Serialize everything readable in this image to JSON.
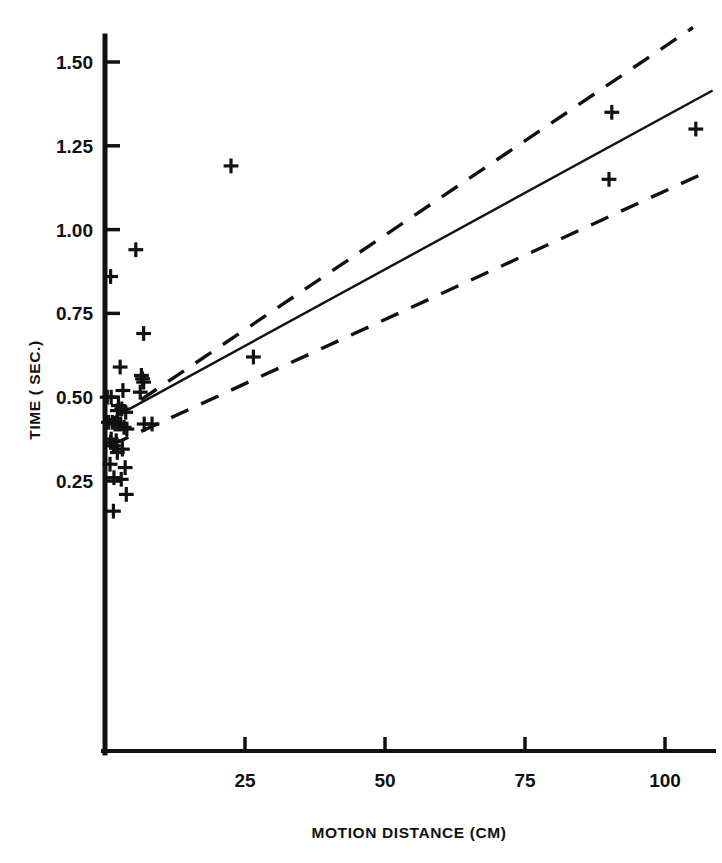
{
  "chart_data": {
    "type": "scatter",
    "title": "",
    "xlabel": "MOTION DISTANCE (CM)",
    "ylabel": "TIME ( SEC.)",
    "xlim": [
      0,
      110
    ],
    "ylim": [
      0,
      1.62
    ],
    "grid": false,
    "legend": "none",
    "marker": "plus",
    "xticks": [
      25,
      50,
      75,
      100
    ],
    "xtick_labels": [
      "25",
      "50",
      "75",
      "100"
    ],
    "yticks": [
      0.25,
      0.5,
      0.75,
      1.0,
      1.25,
      1.5
    ],
    "ytick_labels": [
      "0.25",
      "0.50",
      "0.75",
      "1.00",
      "1.25",
      "1.50"
    ],
    "points": [
      {
        "x": 1.5,
        "y": 0.16
      },
      {
        "x": 3.8,
        "y": 0.21
      },
      {
        "x": 1.6,
        "y": 0.26
      },
      {
        "x": 2.9,
        "y": 0.255
      },
      {
        "x": 0.9,
        "y": 0.3
      },
      {
        "x": 3.6,
        "y": 0.29
      },
      {
        "x": 1.0,
        "y": 0.365
      },
      {
        "x": 2.0,
        "y": 0.37
      },
      {
        "x": 1.5,
        "y": 0.355
      },
      {
        "x": 3.1,
        "y": 0.345
      },
      {
        "x": 1.1,
        "y": 0.375
      },
      {
        "x": 2.2,
        "y": 0.335
      },
      {
        "x": 0.6,
        "y": 0.425
      },
      {
        "x": 1.3,
        "y": 0.425
      },
      {
        "x": 1.8,
        "y": 0.42
      },
      {
        "x": 2.3,
        "y": 0.42
      },
      {
        "x": 2.8,
        "y": 0.42
      },
      {
        "x": 3.4,
        "y": 0.41
      },
      {
        "x": 3.9,
        "y": 0.405
      },
      {
        "x": 7.0,
        "y": 0.42
      },
      {
        "x": 8.4,
        "y": 0.42
      },
      {
        "x": 2.2,
        "y": 0.46
      },
      {
        "x": 3.0,
        "y": 0.465
      },
      {
        "x": 3.7,
        "y": 0.455
      },
      {
        "x": 0.4,
        "y": 0.5
      },
      {
        "x": 1.1,
        "y": 0.5
      },
      {
        "x": 2.4,
        "y": 0.475
      },
      {
        "x": 3.2,
        "y": 0.52
      },
      {
        "x": 6.3,
        "y": 0.515
      },
      {
        "x": 6.9,
        "y": 0.545
      },
      {
        "x": 6.7,
        "y": 0.555
      },
      {
        "x": 6.5,
        "y": 0.565
      },
      {
        "x": 2.7,
        "y": 0.59
      },
      {
        "x": 6.9,
        "y": 0.69
      },
      {
        "x": 1.0,
        "y": 0.86
      },
      {
        "x": 5.5,
        "y": 0.94
      },
      {
        "x": 22.5,
        "y": 1.19
      },
      {
        "x": 26.5,
        "y": 0.62
      },
      {
        "x": 90.5,
        "y": 1.35
      },
      {
        "x": 90.0,
        "y": 1.15
      },
      {
        "x": 105.5,
        "y": 1.3
      }
    ],
    "lines": [
      {
        "name": "regression-line",
        "style": "solid",
        "x0": 0.0,
        "y0": 0.425,
        "x1": 108.5,
        "y1": 1.415
      },
      {
        "name": "upper-confidence-band",
        "style": "dashed",
        "x0": 6.4,
        "y0": 0.492,
        "x1": 105.0,
        "y1": 1.603
      },
      {
        "name": "lower-confidence-band",
        "style": "dashed",
        "x0": 1.1,
        "y0": 0.357,
        "x1": 106.5,
        "y1": 1.165
      }
    ]
  },
  "axes": {
    "x_axis_label": "MOTION DISTANCE (CM)",
    "y_axis_label": "TIME ( SEC.)"
  }
}
